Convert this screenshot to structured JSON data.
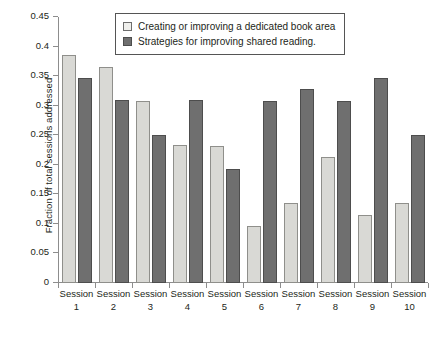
{
  "chart_data": {
    "type": "bar",
    "title": "",
    "xlabel": "",
    "ylabel": "Fraction of total sessions addressed",
    "categories": [
      "Session 1",
      "Session 2",
      "Session 3",
      "Session 4",
      "Session 5",
      "Session 6",
      "Session 7",
      "Session 8",
      "Session 9",
      "Session 10"
    ],
    "category_lines": [
      [
        "Session",
        "1"
      ],
      [
        "Session",
        "2"
      ],
      [
        "Session",
        "3"
      ],
      [
        "Session",
        "4"
      ],
      [
        "Session",
        "5"
      ],
      [
        "Session",
        "6"
      ],
      [
        "Session",
        "7"
      ],
      [
        "Session",
        "8"
      ],
      [
        "Session",
        "9"
      ],
      [
        "Session",
        "10"
      ]
    ],
    "series": [
      {
        "name": "Creating or improving a dedicated book area",
        "color": "#d9d9d5",
        "values": [
          0.385,
          0.366,
          0.308,
          0.233,
          0.232,
          0.097,
          0.135,
          0.213,
          0.115,
          0.135
        ]
      },
      {
        "name": "Strategies for improving shared reading.",
        "color": "#6f6f6f",
        "values": [
          0.347,
          0.309,
          0.251,
          0.309,
          0.193,
          0.308,
          0.328,
          0.308,
          0.347,
          0.251
        ]
      }
    ],
    "ylim": [
      0,
      0.45
    ],
    "ytick_values": [
      0,
      0.05,
      0.1,
      0.15,
      0.2,
      0.25,
      0.3,
      0.35,
      0.4,
      0.45
    ],
    "ytick_labels": [
      "0",
      "0.05",
      "0.1",
      "0.15",
      "0.2",
      "0.25",
      "0.3",
      "0.35",
      "0.4",
      "0.45"
    ],
    "grid": false,
    "legend_position": "top-center"
  },
  "legend": {
    "entries": [
      {
        "label": "Creating or improving a dedicated book area",
        "swatch": "light"
      },
      {
        "label": "Strategies for improving shared reading.",
        "swatch": "dark"
      }
    ]
  },
  "caption": {
    "text": ""
  }
}
